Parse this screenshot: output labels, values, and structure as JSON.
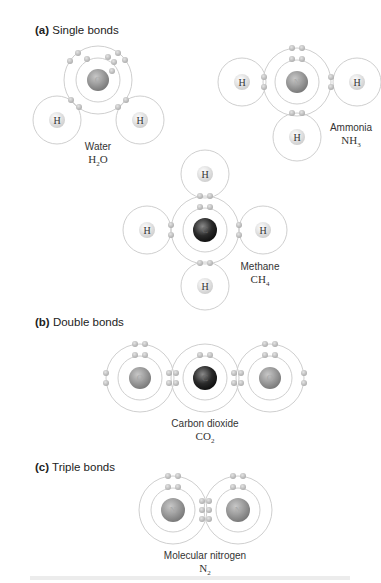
{
  "sections": [
    {
      "id": "a",
      "prefix": "(a)",
      "title": "Single bonds"
    },
    {
      "id": "b",
      "prefix": "(b)",
      "title": "Double bonds"
    },
    {
      "id": "c",
      "prefix": "(c)",
      "title": "Triple bonds"
    }
  ],
  "molecules": {
    "water": {
      "name": "Water",
      "formula_base": "H",
      "formula_sub": "2",
      "formula_tail": "O",
      "center_atom": "O"
    },
    "ammonia": {
      "name": "Ammonia",
      "formula_base": "NH",
      "formula_sub": "3",
      "formula_tail": "",
      "center_atom": "N"
    },
    "methane": {
      "name": "Methane",
      "formula_base": "CH",
      "formula_sub": "4",
      "formula_tail": "",
      "center_atom": "C"
    },
    "carbon_dioxide": {
      "name": "Carbon dioxide",
      "formula_base": "CO",
      "formula_sub": "2",
      "formula_tail": "",
      "center_atom": "C"
    },
    "nitrogen": {
      "name": "Molecular nitrogen",
      "formula_base": "N",
      "formula_sub": "2",
      "formula_tail": "",
      "center_atom": "N"
    }
  },
  "atom_labels": {
    "H": "H",
    "O": "O",
    "N": "N",
    "C": "C"
  },
  "colors": {
    "shell": "#cfcfcf",
    "electron": "#bdbdbd",
    "nucleus_gray": "#8a8a8a",
    "nucleus_dark": "#2b2b2b",
    "hydrogen_nucleus": "#e9e9e9"
  }
}
